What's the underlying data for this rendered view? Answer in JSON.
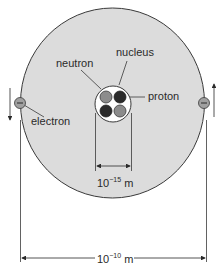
{
  "diagram": {
    "labels": {
      "nucleus": "nucleus",
      "neutron": "neutron",
      "proton": "proton",
      "electron": "electron"
    },
    "dimensions": {
      "nucleus_size": {
        "base": "10",
        "exponent": "−15",
        "unit": "m"
      },
      "atom_size": {
        "base": "10",
        "exponent": "−10",
        "unit": "m"
      }
    },
    "electron_symbol": "−",
    "colors": {
      "atom_fill": "#dcdcdc",
      "outline": "#3a3a3a",
      "nucleus_fill": "#ffffff",
      "neutron": "#8c8c8c",
      "proton": "#2b2b2b",
      "electron": "#a0a0a0"
    },
    "particles": [
      {
        "type": "neutron",
        "position": "top-left"
      },
      {
        "type": "proton",
        "position": "top-right"
      },
      {
        "type": "proton",
        "position": "bottom-left"
      },
      {
        "type": "neutron",
        "position": "bottom-right"
      }
    ]
  }
}
